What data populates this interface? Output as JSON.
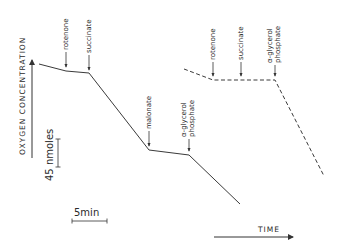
{
  "figure": {
    "y_axis_label": "OXYGEN CONCENTRATION",
    "x_axis_label": "TIME",
    "scale_bars": {
      "vertical": "45 nmoles",
      "horizontal": "5min"
    },
    "traces": [
      {
        "name": "solid trace",
        "style": "solid",
        "additions": [
          {
            "label": "rotenone",
            "lines": [
              "rotenone"
            ]
          },
          {
            "label": "succinate",
            "lines": [
              "succinate"
            ]
          },
          {
            "label": "malonate",
            "lines": [
              "malonate"
            ]
          },
          {
            "label": "α-glycerol phosphate",
            "lines": [
              "α-glycerol",
              "phosphate"
            ]
          }
        ]
      },
      {
        "name": "dashed trace",
        "style": "dashed",
        "additions": [
          {
            "label": "rotenone",
            "lines": [
              "rotenone"
            ]
          },
          {
            "label": "succinate",
            "lines": [
              "succinate"
            ]
          },
          {
            "label": "α-glycerol phosphate",
            "lines": [
              "α-glycerol",
              "phosphate"
            ]
          }
        ]
      }
    ]
  }
}
